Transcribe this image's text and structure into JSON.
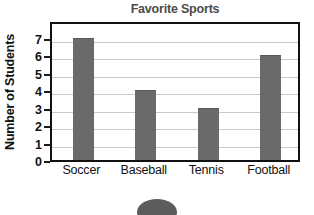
{
  "chart_data": {
    "type": "bar",
    "title": "Favorite Sports",
    "xlabel": "",
    "ylabel": "Number of Students",
    "categories": [
      "Soccer",
      "Baseball",
      "Tennis",
      "Football"
    ],
    "values": [
      7,
      4,
      3,
      6
    ],
    "ylim": [
      0,
      8
    ],
    "yticks": [
      0,
      1,
      2,
      3,
      4,
      5,
      6,
      7
    ],
    "ytick_labels": [
      "0",
      "1",
      "2",
      "3",
      "4",
      "5",
      "6",
      "7"
    ],
    "grid": "horizontal",
    "legend": null,
    "bar_color": "#6a6a6a",
    "title_color": "#4b4b4b",
    "axis_color": "#111111",
    "grid_color": "#c9c9c9",
    "background": "#ffffff"
  },
  "decoration": {
    "blob_name": "page-number-blob"
  }
}
